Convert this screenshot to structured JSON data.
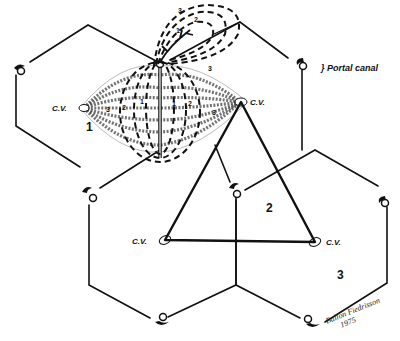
{
  "diagram": {
    "type": "liver-lobule-acinus",
    "labels": {
      "portal_canal": "Portal canal",
      "central_vein": "C.V.",
      "zone_1": "1",
      "zone_2": "2",
      "zone_3": "3",
      "acinus_zone_1": "1",
      "acinus_zone_2": "2",
      "acinus_zone_3": "3",
      "signature": "Ballon Fiedrisson",
      "signature_year": "1975"
    },
    "colors": {
      "line": "#111111",
      "background": "#ffffff"
    }
  }
}
